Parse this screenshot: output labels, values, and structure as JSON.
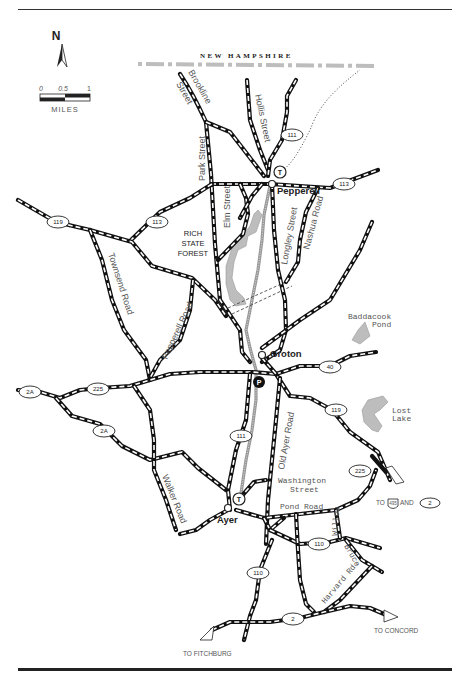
{
  "map": {
    "title_region": "NEW HAMPSHIRE",
    "compass": {
      "label": "N"
    },
    "scale_bar": {
      "ticks": [
        "0",
        "0.5",
        "1"
      ],
      "unit": "MILES"
    },
    "area_label": {
      "line1": "RICH",
      "line2": "STATE",
      "line3": "FOREST"
    },
    "towns": [
      {
        "name": "Pepperell",
        "station": "T"
      },
      {
        "name": "Groton",
        "parking": "P"
      },
      {
        "name": "Ayer",
        "station": "T"
      }
    ],
    "streets": {
      "brookline": "Brookline",
      "brookline_street": "Street",
      "hollis": "Hollis Street",
      "park": "Park Street",
      "elm": "Elm Street",
      "longley": "Longley Street",
      "nashua": "Nashua Road",
      "townsend": "Townsend Road",
      "pepperell_rd": "Pepperell Road",
      "old_ayer": "Old Ayer Road",
      "walker": "Walker Road",
      "washington1": "Washington",
      "washington2": "Street",
      "pond": "Pond Road",
      "willow": "Willow",
      "bruce": "Bruce",
      "harvard": "Harvard Rd."
    },
    "route_shields": {
      "r111_north": "111",
      "r113_east": "113",
      "r119_west": "119",
      "r113_west": "113",
      "r2a_west": "2A",
      "r225_west": "225",
      "r2a_south": "2A",
      "r40": "40",
      "r111_south": "111",
      "r119_east": "119",
      "r225_east": "225",
      "r110_east": "110",
      "r110_south": "110",
      "r2": "2"
    },
    "water_bodies": {
      "baddacook1": "Baddacook",
      "baddacook2": "Pond",
      "lost1": "Lost",
      "lost2": "Lake"
    },
    "destinations": {
      "to_495_prefix": "TO",
      "interstate": "495",
      "and": "AND",
      "route2": "2",
      "concord": "TO CONCORD",
      "fitchburg": "TO FITCHBURG"
    },
    "colors": {
      "road": "#111111",
      "water": "#bdbdbd",
      "rail": "#999999",
      "border": "#bdbdbd"
    }
  }
}
